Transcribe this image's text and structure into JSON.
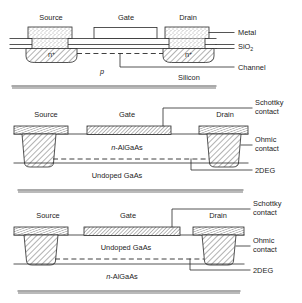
{
  "figure": {
    "colors": {
      "ink": "#2a2a2a",
      "background": "#ffffff",
      "stipple": "#555555",
      "hatch": "#333333"
    }
  },
  "diagrams": [
    {
      "id": "mosfet",
      "name": "silicon-mosfet-cross-section",
      "terminals": {
        "source": "Source",
        "gate": "Gate",
        "drain": "Drain"
      },
      "region_labels": {
        "source_doping": "n",
        "source_doping_sup": "+",
        "drain_doping": "n",
        "drain_doping_sup": "+",
        "substrate": "p"
      },
      "callouts": [
        {
          "name": "metal",
          "label": "Metal"
        },
        {
          "name": "oxide",
          "label": "SiO",
          "sub": "2"
        },
        {
          "name": "channel",
          "label": "Channel"
        },
        {
          "name": "silicon",
          "label": "Silicon"
        }
      ]
    },
    {
      "id": "hemt-normal",
      "name": "algaas-gaas-hemt-cross-section",
      "terminals": {
        "source": "Source",
        "gate": "Gate",
        "drain": "Drain"
      },
      "layers": {
        "upper": "n",
        "upper_rest": "-AlGaAs",
        "lower": "Undoped GaAs"
      },
      "callouts": [
        {
          "name": "schottky",
          "label_line1": "Schottky",
          "label_line2": "contact"
        },
        {
          "name": "ohmic",
          "label_line1": "Ohmic",
          "label_line2": "contact"
        },
        {
          "name": "twodeg",
          "label": "2DEG"
        }
      ]
    },
    {
      "id": "hemt-inverted",
      "name": "inverted-hemt-cross-section",
      "terminals": {
        "source": "Source",
        "gate": "Gate",
        "drain": "Drain"
      },
      "layers": {
        "upper": "Undoped GaAs",
        "lower": "n",
        "lower_rest": "-AlGaAs"
      },
      "callouts": [
        {
          "name": "schottky",
          "label_line1": "Schottky",
          "label_line2": "contact"
        },
        {
          "name": "ohmic",
          "label_line1": "Ohmic",
          "label_line2": "contact"
        },
        {
          "name": "twodeg",
          "label": "2DEG"
        }
      ]
    }
  ]
}
